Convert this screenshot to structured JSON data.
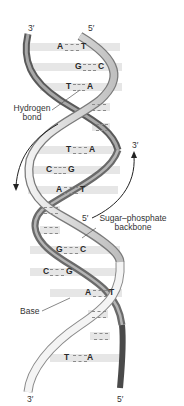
{
  "diagram": {
    "strand_ends": {
      "top_left": "3′",
      "top_right": "5′",
      "bottom_left": "3′",
      "bottom_right": "5′",
      "arrow_up_end": "3′",
      "arrow_backbone_start": "5′"
    },
    "labels": {
      "hydrogen_bond_line1": "Hydrogen",
      "hydrogen_bond_line2": "bond",
      "backbone_line1": "Sugar–phosphate",
      "backbone_line2": "backbone",
      "base": "Base"
    },
    "base_pairs": [
      {
        "left": "A",
        "right": "T"
      },
      {
        "left": "G",
        "right": "C"
      },
      {
        "left": "T",
        "right": "A"
      },
      {
        "left": "",
        "right": ""
      },
      {
        "left": "",
        "right": ""
      },
      {
        "left": "T",
        "right": "A"
      },
      {
        "left": "C",
        "right": "G"
      },
      {
        "left": "A",
        "right": "T"
      },
      {
        "left": "",
        "right": ""
      },
      {
        "left": "",
        "right": ""
      },
      {
        "left": "G",
        "right": "C"
      },
      {
        "left": "C",
        "right": "G"
      },
      {
        "left": "A",
        "right": "T"
      },
      {
        "left": "",
        "right": ""
      },
      {
        "left": "",
        "right": ""
      },
      {
        "left": "T",
        "right": "A"
      }
    ],
    "colors": {
      "strand_dark": "#555555",
      "strand_mid": "#9a9a9a",
      "strand_light": "#d8d8d8",
      "base_bar": "#e6e6e6",
      "text": "#333333"
    }
  }
}
